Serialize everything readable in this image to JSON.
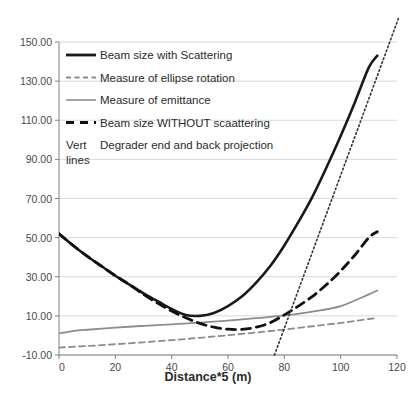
{
  "chart_data": {
    "type": "line",
    "title": "",
    "xlabel": "Distance*5 (m)",
    "ylabel": "",
    "xlim": [
      0,
      120
    ],
    "ylim": [
      -10,
      150
    ],
    "xticks": [
      0,
      20,
      40,
      60,
      80,
      100,
      120
    ],
    "xtick_labels": [
      "0",
      "20",
      "40",
      "60",
      "80",
      "100",
      "120"
    ],
    "yticks": [
      -10,
      10,
      30,
      50,
      70,
      90,
      110,
      130,
      150
    ],
    "ytick_labels": [
      "-10.00",
      "10.00",
      "30.00",
      "50.00",
      "70.00",
      "90.00",
      "110.00",
      "130.00",
      "150.00"
    ],
    "grid": true,
    "legend_position": "upper-left-inside",
    "series": [
      {
        "name": "Beam size with Scattering",
        "style": "solid",
        "color": "#1a1a1a",
        "width": 2.6,
        "x": [
          0,
          5,
          10,
          15,
          20,
          25,
          30,
          35,
          40,
          45,
          50,
          55,
          60,
          65,
          70,
          75,
          80,
          85,
          90,
          95,
          100,
          105,
          110,
          113
        ],
        "y": [
          52,
          46,
          40.5,
          35.5,
          30.5,
          26,
          21.5,
          17.5,
          13.5,
          10.5,
          10,
          11.5,
          15,
          20,
          27,
          35.5,
          46,
          58,
          71,
          86,
          102,
          119,
          137,
          143
        ]
      },
      {
        "name": "Measure of ellipse rotation",
        "style": "dashed",
        "color": "#8c8c8c",
        "width": 1.8,
        "x": [
          0,
          10,
          20,
          30,
          40,
          50,
          60,
          70,
          80,
          90,
          100,
          110,
          113
        ],
        "y": [
          -6.2,
          -5.4,
          -4.5,
          -3.5,
          -2.4,
          -1.2,
          0.1,
          1.5,
          3.0,
          4.7,
          6.4,
          8.4,
          9.0
        ]
      },
      {
        "name": "Measure of emittance",
        "style": "solid",
        "color": "#8c8c8c",
        "width": 1.8,
        "x": [
          0,
          5,
          10,
          20,
          30,
          40,
          50,
          60,
          70,
          80,
          90,
          100,
          110,
          113
        ],
        "y": [
          1.0,
          2.2,
          2.9,
          4.0,
          4.9,
          5.7,
          6.6,
          7.6,
          8.8,
          10.2,
          12.2,
          15.0,
          21.0,
          23.0
        ]
      },
      {
        "name": "Beam size WITHOUT scaattering",
        "style": "dashed-long",
        "color": "#111111",
        "width": 2.8,
        "x": [
          0,
          5,
          10,
          15,
          20,
          25,
          30,
          35,
          40,
          45,
          50,
          55,
          60,
          65,
          70,
          75,
          80,
          85,
          90,
          95,
          100,
          105,
          110,
          113
        ],
        "y": [
          52,
          46,
          40.5,
          35.5,
          30.5,
          26,
          21,
          16.5,
          12.5,
          9.0,
          6.2,
          4.2,
          3.2,
          3.1,
          4.2,
          6.5,
          10.5,
          15.0,
          20.0,
          26.0,
          33.0,
          41.0,
          50.0,
          53.0
        ]
      }
    ],
    "vertical_lines": {
      "name": "Degrader end and back projection",
      "style": "dotted",
      "color": "#333333",
      "description": "Vert lines",
      "lines": [
        {
          "x1": 76.5,
          "y1": -10,
          "x2": 120.5,
          "y2": 162
        }
      ]
    }
  },
  "legend": {
    "entries": [
      {
        "label": "Beam size with Scattering",
        "swatch": "solid-black-thick",
        "prefix": ""
      },
      {
        "label": "Measure of ellipse rotation",
        "swatch": "dashed-gray",
        "prefix": ""
      },
      {
        "label": "Measure of emittance",
        "swatch": "solid-gray",
        "prefix": ""
      },
      {
        "label": "Beam size WITHOUT scaattering",
        "swatch": "dashed-black-thick",
        "prefix": ""
      },
      {
        "label": "Degrader end and back projection",
        "swatch": "none",
        "prefix": "Vert",
        "prefix2": "lines"
      }
    ]
  },
  "axis": {
    "x_title": "Distance*5 (m)"
  },
  "colors": {
    "series_black": "#1a1a1a",
    "series_gray": "#8c8c8c",
    "grid": "#d9d9d9",
    "axis": "#808080",
    "text": "#3b3b3b"
  }
}
